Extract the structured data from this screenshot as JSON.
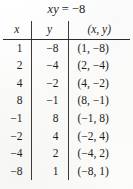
{
  "document": {
    "kind": "math-value-table",
    "title": "xy = −8",
    "equation_lhs": "xy",
    "equation_rhs": "−8",
    "ink_color": "#1c1c1c",
    "rule_color": "#2a2a2a",
    "paper_color": "#fdfdfd"
  },
  "table": {
    "headers": [
      "x",
      "y",
      "(x, y)"
    ],
    "column_count": 3,
    "row_count": 8,
    "rows": [
      {
        "x": "1",
        "y": "−8",
        "pair": "(1, −8)"
      },
      {
        "x": "2",
        "y": "−4",
        "pair": "(2, −4)"
      },
      {
        "x": "4",
        "y": "−2",
        "pair": "(4, −2)"
      },
      {
        "x": "8",
        "y": "−1",
        "pair": "(8, −1)"
      },
      {
        "x": "−1",
        "y": "8",
        "pair": "(−1, 8)"
      },
      {
        "x": "−2",
        "y": "4",
        "pair": "(−2, 4)"
      },
      {
        "x": "−4",
        "y": "2",
        "pair": "(−4, 2)"
      },
      {
        "x": "−8",
        "y": "1",
        "pair": "(−8, 1)"
      }
    ]
  },
  "chart_data": {
    "type": "table",
    "xlabel": "x",
    "ylabel": "y",
    "columns": [
      "x",
      "y",
      "(x, y)"
    ],
    "x": [
      1,
      2,
      4,
      8,
      -1,
      -2,
      -4,
      -8
    ],
    "y": [
      -8,
      -4,
      -2,
      -1,
      8,
      4,
      2,
      1
    ],
    "points": [
      [
        1,
        -8
      ],
      [
        2,
        -4
      ],
      [
        4,
        -2
      ],
      [
        8,
        -1
      ],
      [
        -1,
        8
      ],
      [
        -2,
        4
      ],
      [
        -4,
        2
      ],
      [
        -8,
        1
      ]
    ],
    "relation": "xy = -8",
    "grid": false,
    "legend": null
  }
}
